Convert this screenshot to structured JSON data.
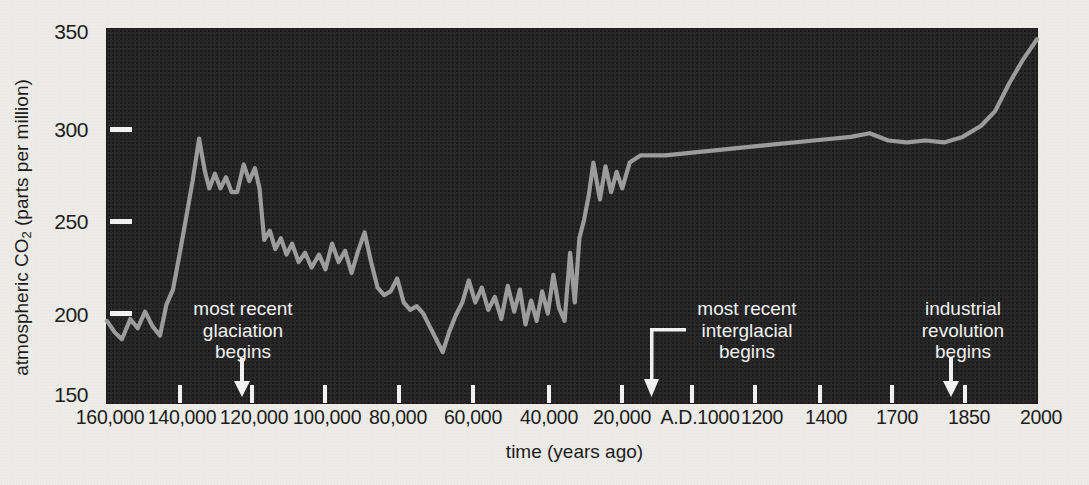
{
  "chart_data": {
    "type": "line",
    "title": "",
    "xlabel": "time (years ago)",
    "ylabel": "atmospheric CO2 (parts per million)",
    "ylabel_plain": "atmospheric CO",
    "ylabel_sub": "2",
    "ylabel_tail": " (parts per million)",
    "ylim": [
      150,
      350
    ],
    "ytick_labels": [
      "350",
      "300",
      "250",
      "200",
      "150"
    ],
    "ytick_values": [
      350,
      300,
      250,
      200,
      150
    ],
    "xtick_labels": [
      "160,000",
      "140,000",
      "120,000",
      "100,000",
      "80,000",
      "60,000",
      "40,000",
      "20,000",
      "A.D.1000",
      "1200",
      "1400",
      "1700",
      "1850",
      "2000"
    ],
    "grid": false,
    "legend": "none",
    "line_color": "#9c9c9c",
    "background_color": "#262626",
    "page_color": "#edebe7",
    "series": [
      {
        "name": "atmospheric CO2",
        "units": "parts per million",
        "points": [
          [
            0.0,
            196
          ],
          [
            0.8,
            190
          ],
          [
            1.6,
            186
          ],
          [
            2.5,
            197
          ],
          [
            3.3,
            192
          ],
          [
            4.1,
            201
          ],
          [
            4.9,
            193
          ],
          [
            5.7,
            188
          ],
          [
            6.4,
            205
          ],
          [
            7.1,
            213
          ],
          [
            7.8,
            232
          ],
          [
            8.5,
            252
          ],
          [
            9.2,
            272
          ],
          [
            9.9,
            295
          ],
          [
            10.5,
            278
          ],
          [
            11.0,
            268
          ],
          [
            11.6,
            276
          ],
          [
            12.2,
            268
          ],
          [
            12.8,
            274
          ],
          [
            13.4,
            266
          ],
          [
            14.0,
            266
          ],
          [
            14.7,
            281
          ],
          [
            15.3,
            272
          ],
          [
            15.9,
            279
          ],
          [
            16.4,
            268
          ],
          [
            16.9,
            240
          ],
          [
            17.5,
            245
          ],
          [
            18.1,
            235
          ],
          [
            18.7,
            241
          ],
          [
            19.3,
            232
          ],
          [
            19.9,
            238
          ],
          [
            20.6,
            228
          ],
          [
            21.3,
            233
          ],
          [
            22.0,
            225
          ],
          [
            22.8,
            232
          ],
          [
            23.5,
            224
          ],
          [
            24.2,
            238
          ],
          [
            24.9,
            228
          ],
          [
            25.6,
            234
          ],
          [
            26.3,
            222
          ],
          [
            27.0,
            234
          ],
          [
            27.7,
            244
          ],
          [
            28.4,
            228
          ],
          [
            29.1,
            214
          ],
          [
            29.8,
            210
          ],
          [
            30.5,
            212
          ],
          [
            31.2,
            219
          ],
          [
            31.9,
            206
          ],
          [
            32.6,
            202
          ],
          [
            33.3,
            204
          ],
          [
            34.0,
            200
          ],
          [
            34.7,
            193
          ],
          [
            35.4,
            186
          ],
          [
            36.1,
            179
          ],
          [
            36.8,
            190
          ],
          [
            37.5,
            199
          ],
          [
            38.2,
            206
          ],
          [
            38.9,
            218
          ],
          [
            39.6,
            206
          ],
          [
            40.3,
            214
          ],
          [
            41.0,
            202
          ],
          [
            41.7,
            209
          ],
          [
            42.4,
            197
          ],
          [
            43.1,
            215
          ],
          [
            43.8,
            201
          ],
          [
            44.4,
            213
          ],
          [
            45.0,
            194
          ],
          [
            45.6,
            207
          ],
          [
            46.2,
            196
          ],
          [
            46.8,
            212
          ],
          [
            47.4,
            200
          ],
          [
            48.0,
            221
          ],
          [
            48.6,
            203
          ],
          [
            49.2,
            196
          ],
          [
            49.8,
            233
          ],
          [
            50.3,
            206
          ],
          [
            50.8,
            241
          ],
          [
            51.3,
            251
          ],
          [
            51.8,
            264
          ],
          [
            52.3,
            282
          ],
          [
            53.0,
            262
          ],
          [
            53.6,
            280
          ],
          [
            54.2,
            266
          ],
          [
            54.8,
            277
          ],
          [
            55.4,
            268
          ],
          [
            56.2,
            282
          ],
          [
            57.4,
            286
          ],
          [
            60.0,
            286
          ],
          [
            64.0,
            288
          ],
          [
            68.0,
            290
          ],
          [
            72.0,
            292
          ],
          [
            76.0,
            294
          ],
          [
            80.0,
            296
          ],
          [
            82.0,
            298
          ],
          [
            84.0,
            294
          ],
          [
            86.0,
            293
          ],
          [
            88.0,
            294
          ],
          [
            90.0,
            293
          ],
          [
            92.0,
            296
          ],
          [
            94.0,
            302
          ],
          [
            95.5,
            310
          ],
          [
            97.0,
            325
          ],
          [
            98.5,
            338
          ],
          [
            100.0,
            349
          ]
        ]
      }
    ],
    "annotations": [
      {
        "id": "most-recent-glaciation",
        "lines": [
          "most recent",
          "glaciation",
          "begins"
        ],
        "arrow": "down",
        "target_x_label": "125,000"
      },
      {
        "id": "most-recent-interglacial",
        "lines": [
          "most recent",
          "interglacial",
          "begins"
        ],
        "arrow": "down-elbow",
        "target_x_label": "15,000"
      },
      {
        "id": "industrial-revolution",
        "lines": [
          "industrial",
          "revolution",
          "begins"
        ],
        "arrow": "down",
        "target_x_label": "1800"
      }
    ]
  }
}
